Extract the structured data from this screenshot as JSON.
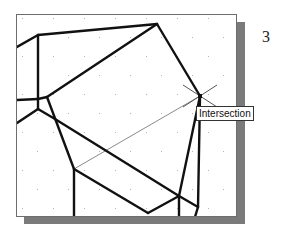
{
  "figure": {
    "step_number": "3"
  },
  "canvas": {
    "background": "#ffffff",
    "border_color": "#6d6d6d",
    "shadow_color": "#7a7a7a",
    "line_color": "#111111",
    "construction_line_color": "#8a8a8a"
  },
  "snap": {
    "marker_icon": "intersection-cross-icon",
    "tooltip_label": "Intersection",
    "point": [
      199,
      95
    ]
  },
  "geometry": {
    "object_lines": [
      [
        [
          16,
          46
        ],
        [
          37,
          34
        ]
      ],
      [
        [
          37,
          34
        ],
        [
          156,
          23
        ]
      ],
      [
        [
          156,
          23
        ],
        [
          199,
          95
        ]
      ],
      [
        [
          37,
          34
        ],
        [
          37,
          98
        ]
      ],
      [
        [
          16,
          99
        ],
        [
          37,
          98
        ]
      ],
      [
        [
          37,
          98
        ],
        [
          46,
          96
        ]
      ],
      [
        [
          46,
          96
        ],
        [
          156,
          23
        ]
      ],
      [
        [
          37,
          98
        ],
        [
          37,
          108
        ]
      ],
      [
        [
          37,
          108
        ],
        [
          16,
          122
        ]
      ],
      [
        [
          37,
          108
        ],
        [
          54,
          118
        ]
      ],
      [
        [
          46,
          96
        ],
        [
          73,
          168
        ]
      ],
      [
        [
          54,
          118
        ],
        [
          178,
          195
        ]
      ],
      [
        [
          73,
          168
        ],
        [
          73,
          216
        ]
      ],
      [
        [
          73,
          168
        ],
        [
          147,
          212
        ]
      ],
      [
        [
          147,
          212
        ],
        [
          178,
          195
        ]
      ],
      [
        [
          178,
          195
        ],
        [
          178,
          216
        ]
      ],
      [
        [
          178,
          195
        ],
        [
          197,
          206
        ]
      ],
      [
        [
          197,
          206
        ],
        [
          194,
          216
        ]
      ],
      [
        [
          199,
          95
        ],
        [
          178,
          195
        ]
      ],
      [
        [
          199,
          95
        ],
        [
          197,
          206
        ]
      ]
    ],
    "construction_lines": [
      [
        [
          73,
          168
        ],
        [
          199,
          95
        ]
      ]
    ]
  }
}
